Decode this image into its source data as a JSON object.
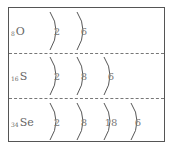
{
  "rows": [
    {
      "symbol": "O",
      "atomic_number": "8",
      "shells": [
        "2",
        "6"
      ]
    },
    {
      "symbol": "S",
      "atomic_number": "16",
      "shells": [
        "2",
        "8",
        "6"
      ]
    },
    {
      "symbol": "Se",
      "atomic_number": "34",
      "shells": [
        "2",
        "8",
        "18",
        "6"
      ]
    }
  ],
  "colors": {
    "border": "#555555",
    "divider": "#777777",
    "text": "#666666"
  }
}
